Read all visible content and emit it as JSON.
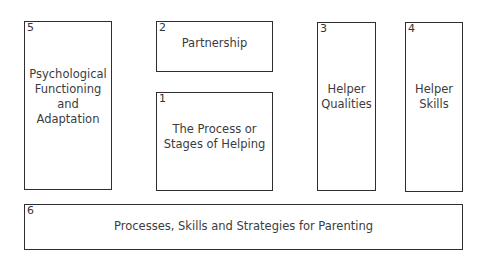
{
  "diagram": {
    "boxes": [
      {
        "number": "5",
        "label": "Psychological\nFunctioning\nand\nAdaptation"
      },
      {
        "number": "2",
        "label": "Partnership"
      },
      {
        "number": "1",
        "label": "The Process or\nStages of Helping"
      },
      {
        "number": "3",
        "label": "Helper\nQualities"
      },
      {
        "number": "4",
        "label": "Helper\nSkills"
      },
      {
        "number": "6",
        "label": "Processes, Skills and Strategies for Parenting"
      }
    ]
  }
}
